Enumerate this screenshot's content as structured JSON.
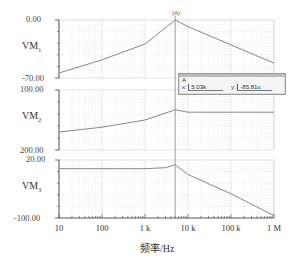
{
  "chart_data": {
    "type": "line",
    "title": "",
    "xlabel": "频率/Hz",
    "xscale": "log",
    "xlim": [
      10,
      1000000
    ],
    "x_ticks": [
      "10",
      "100",
      "1 k",
      "10 k",
      "100 k",
      "1 M"
    ],
    "panels": [
      {
        "ylabel": "VM1",
        "ylabel_main": "VM",
        "ylabel_sub": "1",
        "ylim": [
          -70,
          0
        ],
        "y_ticks": [
          "0.00",
          "-70.00"
        ],
        "series": [
          {
            "name": "VM1",
            "x": [
              10,
              100,
              1000,
              5030,
              10000,
              100000,
              1000000
            ],
            "values": [
              -64,
              -48,
              -29,
              0,
              -8,
              -30,
              -52
            ]
          }
        ]
      },
      {
        "ylabel": "VM2",
        "ylabel_main": "VM",
        "ylabel_sub": "2",
        "ylim": [
          200,
          100
        ],
        "y_ticks": [
          "100.00",
          "200.00"
        ],
        "series": [
          {
            "name": "VM2",
            "x": [
              10,
              100,
              1000,
              5030,
              10000,
              100000,
              1000000
            ],
            "values": [
              170,
              162,
              150,
              133,
              137,
              137,
              137
            ]
          }
        ]
      },
      {
        "ylabel": "VM3",
        "ylabel_main": "VM",
        "ylabel_sub": "3",
        "ylim": [
          -100,
          20
        ],
        "y_ticks": [
          "20.00",
          "-100.00"
        ],
        "series": [
          {
            "name": "VM3",
            "x": [
              10,
              100,
              1000,
              3000,
              5030,
              10000,
              100000,
              1000000
            ],
            "values": [
              2,
              2,
              2,
              4,
              10,
              -10,
              -50,
              -95
            ]
          }
        ]
      }
    ],
    "cursor": {
      "x": 5030,
      "marker": "(A)"
    },
    "grid": true
  },
  "cursor_readout": {
    "label": "A",
    "x_label": "x:",
    "x_value": "5.03k",
    "y_label": "y:",
    "y_value": "-85.81u"
  },
  "colors": {
    "trace": "#888888",
    "grid": "#d8d8d8",
    "axis": "#444444"
  }
}
